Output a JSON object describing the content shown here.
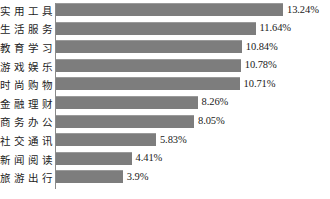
{
  "chart_data": {
    "type": "bar",
    "orientation": "horizontal",
    "title": "",
    "subtitle": "",
    "xlabel": "",
    "ylabel": "",
    "grid": false,
    "legend": null,
    "axis": {
      "value_axis_visible": false,
      "category_axis_visible": true,
      "category_axis_color": "#8a8a8a",
      "xlim": [
        0,
        13.24
      ]
    },
    "bar_color": "#7d7d7d",
    "bar_edge_color": "#9a9a9a",
    "value_suffix": "%",
    "categories": [
      "实用工具",
      "生活服务",
      "教育学习",
      "游戏娱乐",
      "时尚购物",
      "金融理财",
      "商务办公",
      "社交通讯",
      "新闻阅读",
      "旅游出行"
    ],
    "values": [
      13.24,
      11.64,
      10.84,
      10.78,
      10.71,
      8.26,
      8.05,
      5.83,
      4.41,
      3.9
    ],
    "labels": [
      "13.24%",
      "11.64%",
      "10.84%",
      "10.78%",
      "10.71%",
      "8.26%",
      "8.05%",
      "5.83%",
      "4.41%",
      "3.9%"
    ]
  },
  "bars": [
    {
      "category": "实用工具",
      "value": 13.24,
      "label": "13.24%"
    },
    {
      "category": "生活服务",
      "value": 11.64,
      "label": "11.64%"
    },
    {
      "category": "教育学习",
      "value": 10.84,
      "label": "10.84%"
    },
    {
      "category": "游戏娱乐",
      "value": 10.78,
      "label": "10.78%"
    },
    {
      "category": "时尚购物",
      "value": 10.71,
      "label": "10.71%"
    },
    {
      "category": "金融理财",
      "value": 8.26,
      "label": "8.26%"
    },
    {
      "category": "商务办公",
      "value": 8.05,
      "label": "8.05%"
    },
    {
      "category": "社交通讯",
      "value": 5.83,
      "label": "5.83%"
    },
    {
      "category": "新闻阅读",
      "value": 4.41,
      "label": "4.41%"
    },
    {
      "category": "旅游出行",
      "value": 3.9,
      "label": "3.9%"
    }
  ]
}
